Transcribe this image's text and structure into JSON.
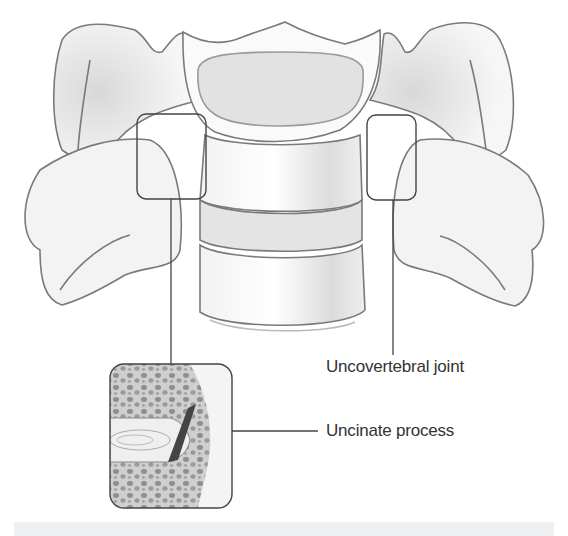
{
  "figure": {
    "labels": [
      {
        "id": "uncovertebral-joint",
        "text": "Uncovertebral joint"
      },
      {
        "id": "uncinate-process",
        "text": "Uncinate process"
      }
    ],
    "callouts": [
      {
        "name": "left-joint-box",
        "x": 137,
        "y": 114,
        "w": 69,
        "h": 85
      },
      {
        "name": "right-joint-box",
        "x": 367,
        "y": 115,
        "w": 49,
        "h": 85
      }
    ],
    "inset": {
      "name": "joint-detail-inset",
      "x": 110,
      "y": 364,
      "w": 122,
      "h": 144
    },
    "colors": {
      "outline": "#7a7a7a",
      "bone_fill": "#f4f4f4",
      "shade": "#d9d9d9",
      "box_stroke": "#444444",
      "text": "#333333",
      "caption_bar": "#eef0f1"
    }
  }
}
